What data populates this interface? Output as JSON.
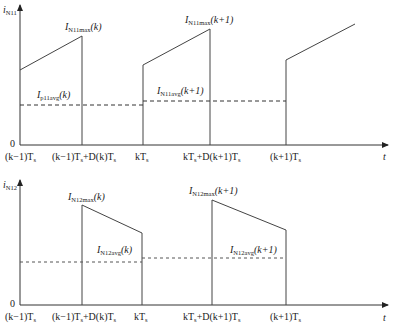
{
  "top_plot": {
    "y_axis_label": "i",
    "y_axis_sub": "N11",
    "origin_label": "0",
    "x_axis_label": "t",
    "x_ticks": [
      "(k−1)T",
      "(k−1)T+D(k)T",
      "kT",
      "kT+D(k+1)T",
      "(k+1)T"
    ],
    "x_tick_labels": {
      "t0": {
        "a": "(",
        "k": "k",
        "b": "−1)",
        "T": "T",
        "s": "s"
      },
      "t1": "(k−1)Ts+D(k)Ts",
      "t2": "kTs",
      "t3": "kTs+D(k+1)Ts",
      "t4": "(k+1)Ts"
    },
    "annotations": {
      "max_k": {
        "main": "I",
        "sub": "N11max",
        "arg": "(k)"
      },
      "max_k1": {
        "main": "I",
        "sub": "N11max",
        "arg": "(k+1)"
      },
      "avg_k": {
        "main": "I",
        "sub": "p11avg",
        "arg": "(k)"
      },
      "avg_k1": {
        "main": "I",
        "sub": "N11avg",
        "arg": "(k+1)"
      }
    }
  },
  "bottom_plot": {
    "y_axis_label": "i",
    "y_axis_sub": "N12",
    "origin_label": "0",
    "x_axis_label": "t",
    "annotations": {
      "max_k": {
        "main": "I",
        "sub": "N12max",
        "arg": "(k)"
      },
      "max_k1": {
        "main": "I",
        "sub": "N12max",
        "arg": "(k+1)"
      },
      "avg_k": {
        "main": "I",
        "sub": "N12avg",
        "arg": "(k)"
      },
      "avg_k1": {
        "main": "I",
        "sub": "N12avg",
        "arg": "(k+1)"
      }
    }
  },
  "tick_text": {
    "t0": "(k−1)T",
    "t1a": "(k−1)T",
    "t1b": "+D(k)T",
    "t2": "kT",
    "t3a": "kT",
    "t3b": "+D(k+1)T",
    "t4": "(k+1)T",
    "s": "s"
  }
}
